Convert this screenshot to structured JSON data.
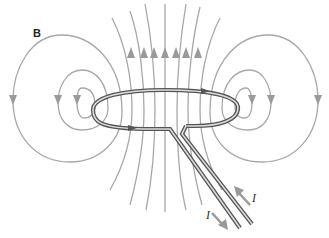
{
  "figure": {
    "field_label": "B",
    "current_label_in": "I",
    "current_label_out": "I"
  },
  "colors": {
    "field_lines": "#a8a8a8",
    "arrows": "#9a9a9a",
    "wire_outer": "#555555",
    "wire_inner": "#d8d8d8",
    "background": "#ffffff"
  }
}
